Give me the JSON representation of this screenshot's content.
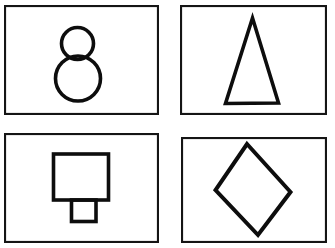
{
  "figure": {
    "title": "",
    "background_color": "#ffffff",
    "stroke_color": "#0d0d0d",
    "panel_border_color": "#151515",
    "width": 335,
    "height": 248,
    "layout": "2x2 grid of bordered panels, each containing one black outline geometric shape"
  },
  "panels": [
    {
      "id": "panel-top-left",
      "position": "top-left",
      "shape_name": "two-stacked-circles",
      "shape_label": "Two stacked circles",
      "caption": "",
      "frame": {
        "x": 4,
        "y": 5,
        "width": 155,
        "height": 110
      },
      "shape_geometry": {
        "type": "circles",
        "circles": [
          {
            "cx": 77.5,
            "cy": 43.5,
            "r": 16.0,
            "role": "upper-small-circle"
          },
          {
            "cx": 78.0,
            "cy": 78.5,
            "r": 22.5,
            "role": "lower-large-circle"
          }
        ],
        "stroke_width": 3.6
      }
    },
    {
      "id": "panel-top-right",
      "position": "top-right",
      "shape_name": "narrow-triangle",
      "shape_label": "Tall narrow triangle",
      "caption": "",
      "frame": {
        "x": 180,
        "y": 5,
        "width": 147,
        "height": 110
      },
      "shape_geometry": {
        "type": "polygon",
        "points": [
          [
            252.5,
            18.0
          ],
          [
            278.5,
            103.0
          ],
          [
            225.5,
            103.5
          ]
        ],
        "stroke_width": 3.6
      }
    },
    {
      "id": "panel-bottom-left",
      "position": "bottom-left",
      "shape_name": "square-with-stem",
      "shape_label": "Square with small rectangular stem below",
      "caption": "",
      "frame": {
        "x": 4,
        "y": 133,
        "width": 155,
        "height": 110
      },
      "shape_geometry": {
        "type": "composite",
        "parts": [
          {
            "type": "rect",
            "x": 53.5,
            "y": 154.0,
            "width": 55.0,
            "height": 46.0,
            "role": "upper-square"
          },
          {
            "type": "rect",
            "x": 71.5,
            "y": 200.0,
            "width": 24.5,
            "height": 21.5,
            "role": "lower-stem"
          }
        ],
        "stroke_width": 3.6
      }
    },
    {
      "id": "panel-bottom-right",
      "position": "bottom-right",
      "shape_name": "tilted-diamond",
      "shape_label": "Tilted diamond (rotated square)",
      "caption": "",
      "frame": {
        "x": 181,
        "y": 137,
        "width": 146,
        "height": 106
      },
      "shape_geometry": {
        "type": "polygon",
        "points": [
          [
            247.0,
            144.0
          ],
          [
            290.5,
            192.0
          ],
          [
            258.0,
            235.0
          ],
          [
            215.5,
            190.0
          ]
        ],
        "stroke_width": 4.0
      }
    }
  ]
}
